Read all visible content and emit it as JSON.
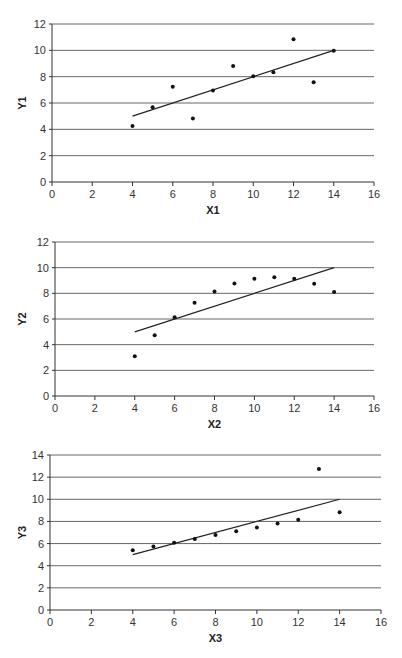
{
  "chart_data": [
    {
      "type": "scatter",
      "title": "",
      "xlabel": "X1",
      "ylabel": "Y1",
      "xlim": [
        0,
        16
      ],
      "ylim": [
        0,
        12
      ],
      "xticks": [
        0,
        2,
        4,
        6,
        8,
        10,
        12,
        14,
        16
      ],
      "yticks": [
        0,
        2,
        4,
        6,
        8,
        10,
        12
      ],
      "grid": "horizontal",
      "legend": "none",
      "x": [
        4,
        5,
        6,
        7,
        8,
        9,
        10,
        11,
        12,
        13,
        14
      ],
      "y": [
        4.26,
        5.68,
        7.24,
        4.82,
        6.95,
        8.81,
        8.04,
        8.33,
        10.84,
        7.58,
        9.96
      ],
      "trendline": {
        "x": [
          4,
          14
        ],
        "y": [
          5.0,
          10.0
        ]
      },
      "box": {
        "x0": 52,
        "x1": 374,
        "y0": 182,
        "y1": 24
      }
    },
    {
      "type": "scatter",
      "title": "",
      "xlabel": "X2",
      "ylabel": "Y2",
      "xlim": [
        0,
        16
      ],
      "ylim": [
        0,
        12
      ],
      "xticks": [
        0,
        2,
        4,
        6,
        8,
        10,
        12,
        14,
        16
      ],
      "yticks": [
        0,
        2,
        4,
        6,
        8,
        10,
        12
      ],
      "grid": "horizontal",
      "legend": "none",
      "x": [
        4,
        5,
        6,
        7,
        8,
        9,
        10,
        11,
        12,
        13,
        14
      ],
      "y": [
        3.1,
        4.74,
        6.13,
        7.26,
        8.14,
        8.77,
        9.14,
        9.26,
        9.13,
        8.74,
        8.1
      ],
      "trendline": {
        "x": [
          4,
          14
        ],
        "y": [
          5.0,
          10.0
        ]
      },
      "box": {
        "x0": 55,
        "x1": 374,
        "y0": 396,
        "y1": 242
      }
    },
    {
      "type": "scatter",
      "title": "",
      "xlabel": "X3",
      "ylabel": "Y3",
      "xlim": [
        0,
        16
      ],
      "ylim": [
        0,
        14
      ],
      "xticks": [
        0,
        2,
        4,
        6,
        8,
        10,
        12,
        14,
        16
      ],
      "yticks": [
        0,
        2,
        4,
        6,
        8,
        10,
        12,
        14
      ],
      "grid": "horizontal",
      "legend": "none",
      "x": [
        4,
        5,
        6,
        7,
        8,
        9,
        10,
        11,
        12,
        13,
        14
      ],
      "y": [
        5.39,
        5.73,
        6.08,
        6.42,
        6.77,
        7.11,
        7.46,
        7.81,
        8.15,
        12.74,
        8.84
      ],
      "trendline": {
        "x": [
          4,
          14
        ],
        "y": [
          5.0,
          10.0
        ]
      },
      "box": {
        "x0": 50,
        "x1": 381,
        "y0": 610,
        "y1": 455
      }
    }
  ]
}
